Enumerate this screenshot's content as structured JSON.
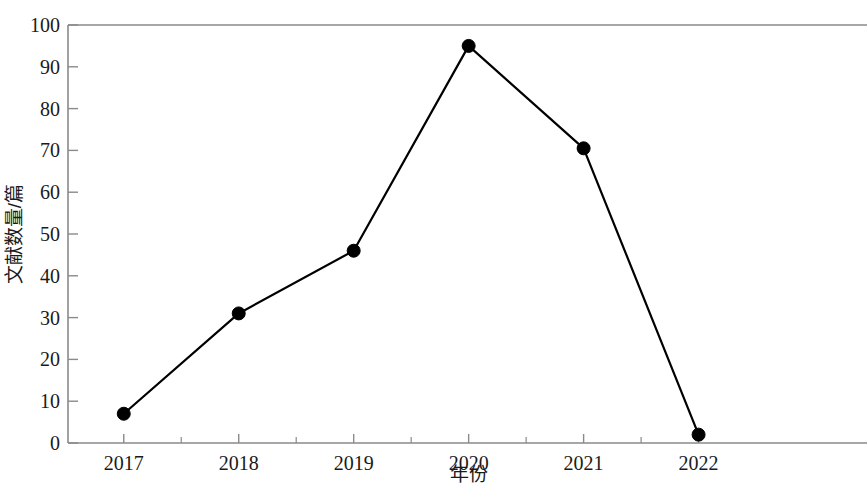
{
  "chart_data": {
    "type": "line",
    "title": "",
    "xlabel": "年份",
    "ylabel": "文献数量/篇",
    "categories": [
      "2017",
      "2018",
      "2019",
      "2020",
      "2021",
      "2022"
    ],
    "values": [
      7,
      31,
      46,
      95,
      70.5,
      2
    ],
    "series": [
      {
        "name": "文献数量",
        "values": [
          7,
          31,
          46,
          95,
          70.5,
          2
        ]
      }
    ],
    "ylim": [
      0,
      100
    ],
    "y_ticks": [
      0,
      10,
      20,
      30,
      40,
      50,
      60,
      70,
      80,
      90,
      100
    ],
    "y_tick_labels": [
      "0",
      "10",
      "20",
      "30",
      "40",
      "50",
      "60",
      "70",
      "80",
      "90",
      "100"
    ],
    "x_tick_labels": [
      "2017",
      "2018",
      "2019",
      "2020",
      "2021",
      "2022"
    ],
    "x_minor_ticks": true,
    "grid": false,
    "legend": false,
    "legend_position": "none",
    "marker": "circle",
    "marker_color": "#000000",
    "line_color": "#000000",
    "axis_color": "#8a8a8a",
    "background_color": "#ffffff"
  }
}
